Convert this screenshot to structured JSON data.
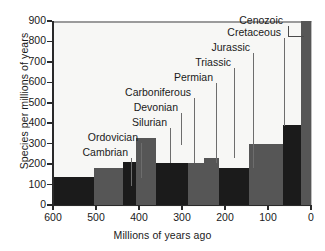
{
  "chart_data": {
    "type": "bar",
    "title": "",
    "xlabel": "Millions of years ago",
    "ylabel": "Species per millions of years",
    "xlim": [
      600,
      0
    ],
    "ylim": [
      0,
      900
    ],
    "xticks": [
      "600",
      "500",
      "400",
      "300",
      "200",
      "100",
      "0"
    ],
    "yticks": [
      "0",
      "100",
      "200",
      "300",
      "400",
      "500",
      "600",
      "700",
      "800",
      "900"
    ],
    "grid": false,
    "legend": "none",
    "x_axis_direction": "reversed",
    "categories": [
      "Cambrian",
      "Ordovician",
      "Silurian",
      "Devonian",
      "Carboniferous",
      "Permian",
      "Triassic",
      "Jurassic",
      "Cretaceous",
      "Cenozoic"
    ],
    "values": [
      135,
      180,
      210,
      330,
      207,
      207,
      232,
      183,
      300,
      390
    ],
    "bars": [
      {
        "name": "Cambrian",
        "x_start": 600,
        "x_end": 505,
        "value": 135,
        "color": "#1b1b1b"
      },
      {
        "name": "Ordovician",
        "x_start": 505,
        "x_end": 438,
        "value": 180,
        "color": "#565656"
      },
      {
        "name": "Silurian",
        "x_start": 438,
        "x_end": 408,
        "value": 210,
        "color": "#1b1b1b"
      },
      {
        "name": "Devonian",
        "x_start": 408,
        "x_end": 360,
        "value": 330,
        "color": "#565656"
      },
      {
        "name": "Carboniferous",
        "x_start": 360,
        "x_end": 286,
        "value": 207,
        "color": "#1b1b1b"
      },
      {
        "name": "Permian",
        "x_start": 286,
        "x_end": 248,
        "value": 207,
        "color": "#565656"
      },
      {
        "name": "Triassic",
        "x_start": 248,
        "x_end": 213,
        "value": 232,
        "color": "#565656"
      },
      {
        "name": "Jurassic",
        "x_start": 213,
        "x_end": 144,
        "value": 183,
        "color": "#1b1b1b"
      },
      {
        "name": "Cretaceous",
        "x_start": 144,
        "x_end": 66,
        "value": 300,
        "color": "#565656"
      },
      {
        "name": "Tertiary",
        "x_start": 66,
        "x_end": 24,
        "value": 390,
        "color": "#1b1b1b"
      },
      {
        "name": "Cenozoic",
        "x_start": 24,
        "x_end": 0,
        "value": 900,
        "color": "#565656"
      }
    ],
    "annotations": [
      {
        "label": "Cambrian",
        "text_right_px": 128,
        "text_top_px": 146,
        "leader_x_px": 131,
        "leader_top_px": 158,
        "leader_bottom_px": 186,
        "bracket": false
      },
      {
        "label": "Ordovician",
        "text_right_px": 138,
        "text_top_px": 131,
        "leader_x_px": 141,
        "leader_top_px": 143,
        "leader_bottom_px": 178,
        "bracket": false
      },
      {
        "label": "Silurian",
        "text_right_px": 167,
        "text_top_px": 116,
        "leader_x_px": 170,
        "leader_top_px": 128,
        "leader_bottom_px": 163,
        "bracket": false
      },
      {
        "label": "Devonian",
        "text_right_px": 178,
        "text_top_px": 101,
        "leader_x_px": 181,
        "leader_top_px": 113,
        "leader_bottom_px": 145,
        "bracket": false
      },
      {
        "label": "Carboniferous",
        "text_right_px": 191,
        "text_top_px": 86,
        "leader_x_px": 194,
        "leader_top_px": 98,
        "leader_bottom_px": 163,
        "bracket": false
      },
      {
        "label": "Permian",
        "text_right_px": 213,
        "text_top_px": 71,
        "leader_x_px": 216,
        "leader_top_px": 83,
        "leader_bottom_px": 163,
        "bracket": false
      },
      {
        "label": "Triassic",
        "text_right_px": 231,
        "text_top_px": 56,
        "leader_x_px": 234,
        "leader_top_px": 68,
        "leader_bottom_px": 158,
        "bracket": false
      },
      {
        "label": "Jurassic",
        "text_right_px": 250,
        "text_top_px": 41,
        "leader_x_px": 253,
        "leader_top_px": 53,
        "leader_bottom_px": 168,
        "bracket": false
      },
      {
        "label": "Cretaceous",
        "text_right_px": 281,
        "text_top_px": 26,
        "leader_x_px": 284,
        "leader_top_px": 38,
        "leader_bottom_px": 126,
        "bracket": false
      },
      {
        "label": "Cenozoic",
        "text_right_px": 283,
        "text_top_px": 14,
        "leader_x_px": 288,
        "leader_top_px": 26,
        "leader_bottom_px": 36,
        "bracket": true
      }
    ],
    "colors": {
      "bar_dark": "#1b1b1b",
      "bar_gray": "#565656",
      "plot_background": "#f7f7f5",
      "axis": "#2a2a2a",
      "leader_line": "#6d6d6d",
      "text": "#1a1a1a"
    }
  }
}
